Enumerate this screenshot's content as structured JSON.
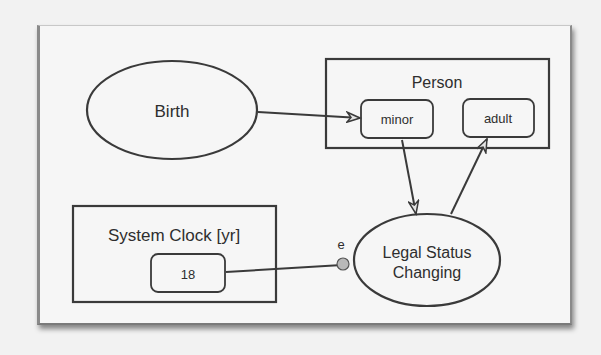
{
  "diagram": {
    "type": "OPM object-process diagram",
    "colors": {
      "stroke": "#3a3a3a",
      "text": "#2e2e2e",
      "event_dot": "#b8b8b8",
      "background": "#f2f2f2",
      "frame": "#f6f6f6"
    },
    "processes": {
      "birth": {
        "label": "Birth"
      },
      "legal_status": {
        "label_line1": "Legal Status",
        "label_line2": "Changing"
      }
    },
    "objects": {
      "person": {
        "label": "Person",
        "states": {
          "minor": "minor",
          "adult": "adult"
        }
      },
      "system_clock": {
        "label": "System Clock [yr]",
        "value": "18"
      }
    },
    "links": {
      "event_label": "e",
      "list": [
        {
          "from": "Birth",
          "to": "minor",
          "kind": "result"
        },
        {
          "from": "minor",
          "to": "Legal Status Changing",
          "kind": "consumption"
        },
        {
          "from": "Legal Status Changing",
          "to": "adult",
          "kind": "result"
        },
        {
          "from": "18",
          "to": "Legal Status Changing",
          "kind": "event"
        }
      ]
    }
  }
}
